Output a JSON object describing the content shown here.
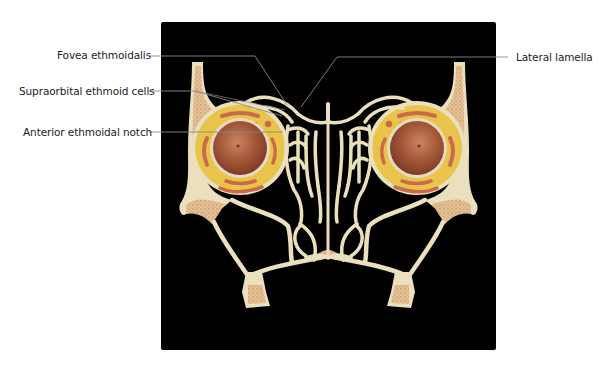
{
  "figure": {
    "background_color": "#000000",
    "colors": {
      "bone": "#eae0bd",
      "cancellous_bone": "#d7a878",
      "orbital_fat": "#e9c64a",
      "globe": "#a9613e",
      "muscle": "#c96a4a",
      "leader_line": "#8a8a8a"
    }
  },
  "labels": {
    "fovea_ethmoidalis": "Fovea ethmoidalis",
    "supraorbital_ethmoid_cells": "Supraorbital ethmoid cells",
    "anterior_ethmoidal_notch": "Anterior ethmoidal notch",
    "lateral_lamella": "Lateral lamella"
  }
}
